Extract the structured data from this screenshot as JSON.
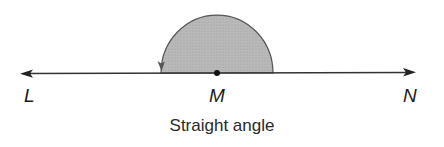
{
  "diagram": {
    "caption": "Straight angle",
    "points": {
      "left": "L",
      "vertex": "M",
      "right": "N"
    },
    "angle_type": "straight",
    "angle_measure_deg": 180,
    "colors": {
      "fill": "#b5b5b5",
      "stroke": "#444444",
      "line": "#333333"
    }
  }
}
